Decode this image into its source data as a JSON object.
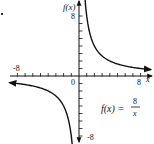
{
  "chart_data": {
    "type": "line",
    "title": "",
    "function_label": "f(x) = 8/x",
    "function_lhs": "f(x) =",
    "function_num": "8",
    "function_den": "x",
    "xlabel": "x",
    "ylabel": "f(x)",
    "xlim": [
      -8,
      8
    ],
    "ylim": [
      -8,
      8
    ],
    "x_tick_labels": [
      "-8",
      "8"
    ],
    "y_tick_labels": [
      "8",
      "-8"
    ],
    "origin_label": "0",
    "grid": false,
    "series": [
      {
        "name": "f(x) = 8/x, x > 0",
        "x": [
          0.5,
          1,
          2,
          4,
          8,
          10.5
        ],
        "y": [
          16,
          8,
          4,
          2,
          1,
          0.76
        ]
      },
      {
        "name": "f(x) = 8/x, x < 0",
        "x": [
          -10.5,
          -8,
          -4,
          -2,
          -1,
          -0.5
        ],
        "y": [
          -0.76,
          -1,
          -2,
          -4,
          -8,
          -16
        ]
      }
    ]
  },
  "marker_dot": "."
}
